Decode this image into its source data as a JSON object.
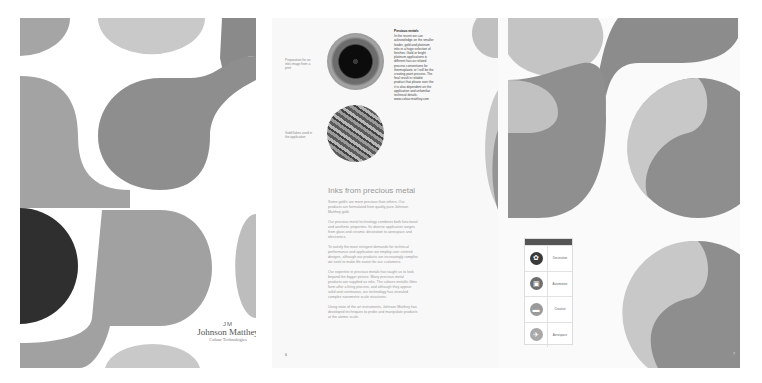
{
  "cover": {
    "brand_mark": "JM",
    "brand_name": "Johnson Matthey",
    "brand_sub": "Colour Technologies",
    "colors": {
      "light": "#c7c7c7",
      "mid": "#9b9b9b",
      "dark": "#868686",
      "black": "#2f2f2f"
    }
  },
  "inner_left": {
    "captions": [
      {
        "text": "Preparation for an inks image from a print"
      },
      {
        "text": "Gold flakes used in the application"
      }
    ],
    "photos": [
      {
        "name": "nozzle-photo"
      },
      {
        "name": "gold-flakes-photo"
      }
    ],
    "sidebar": {
      "title": "Precious metals",
      "text": "In the recent we can acknowledge on the smaller leader, gold and platinum inks in a huge selection of finishes. Gold or bright platinum applications is different has as related process conventions for thermoplastic or I will be the creating paint process. The final result is reliable product that please over the it is also dependent on the application and unfamiliar technical details. www.colour.matthey.com"
    },
    "headline": "Inks from precious metal",
    "paragraphs": [
      "Some gold's are more precious than others. Our products are formulated from quality pure Johnson Matthey gold.",
      "Our precious metal technology combines both functional and aesthetic properties. Its diverse application ranges from glass and ceramic decoration to aerospace and electronics.",
      "To satisfy the most stringent demands for technical performance and application we employ user centred designs, although our products are increasingly complex we seek to make life easier for our customers.",
      "Our expertise in precious metals has taught us to look beyond the bigger picture. Many precious metal products are supplied as inks. The colours metallic films form after a firing process, and although they appear solid and continuous, our technology has revealed complex nanometre scale structures.",
      "Using state of the art instruments, Johnson Matthey has developed techniques to probe and manipulate products at the atomic scale."
    ],
    "page_number": "6"
  },
  "inner_right": {
    "panel": {
      "rows": [
        {
          "icon": "decoration-icon",
          "label": "Decoration",
          "color": "#3a3a3a"
        },
        {
          "icon": "automotive-icon",
          "label": "Automotive",
          "color": "#6e6e6e"
        },
        {
          "icon": "creative-icon",
          "label": "Creative",
          "color": "#9a9a9a"
        },
        {
          "icon": "aerospace-icon",
          "label": "Aerospace",
          "color": "#a8a8a8"
        }
      ]
    },
    "page_number": "7"
  }
}
